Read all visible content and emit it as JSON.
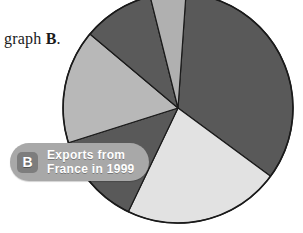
{
  "page": {
    "background": "#ffffff",
    "width": 303,
    "height": 233
  },
  "caption": {
    "prefix": "graph ",
    "bold": "B",
    "suffix": "."
  },
  "callout": {
    "badge_letter": "B",
    "line1": "Exports from",
    "line2": "France in 1999",
    "background_color": "#a8a8a8",
    "badge_color": "#7d7d7d",
    "text_color": "#ffffff"
  },
  "chart_data": {
    "type": "pie",
    "title": "Exports from France in 1999",
    "xlabel": "",
    "ylabel": "",
    "legend_position": "none",
    "grid": false,
    "center_x": 178,
    "center_y": 108,
    "radius": 115,
    "start_angle_deg": -86,
    "outline_color": "#1a1a1a",
    "categories": [
      "Slice 1",
      "Slice 2",
      "Slice 3",
      "Slice 4",
      "Slice 5",
      "Slice 6"
    ],
    "values": [
      34,
      22,
      13,
      16,
      10,
      5
    ],
    "colors": [
      "#595959",
      "#e2e2e2",
      "#595959",
      "#b8b8b8",
      "#5a5a5a",
      "#b0b0b0"
    ]
  }
}
